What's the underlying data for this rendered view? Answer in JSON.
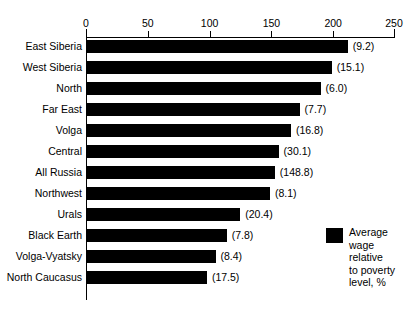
{
  "chart_data": {
    "type": "bar",
    "orientation": "horizontal",
    "title": "",
    "xlabel": "",
    "ylabel": "",
    "xlim": [
      0,
      250
    ],
    "xticks": [
      0,
      50,
      100,
      150,
      200,
      250
    ],
    "grid": false,
    "axis_position": "top",
    "categories": [
      "East Siberia",
      "West Siberia",
      "North",
      "Far East",
      "Volga",
      "Central",
      "All Russia",
      "Northwest",
      "Urals",
      "Black Earth",
      "Volga-Vyatsky",
      "North Caucasus"
    ],
    "values": [
      211,
      198,
      189,
      172,
      165,
      155,
      152,
      148,
      124,
      113,
      104,
      97
    ],
    "point_labels": [
      "(9.2)",
      "(15.1)",
      "(6.0)",
      "(7.7)",
      "(16.8)",
      "(30.1)",
      "(148.8)",
      "(8.1)",
      "(20.4)",
      "(7.8)",
      "(8.4)",
      "(17.5)"
    ],
    "legend": {
      "position": "right",
      "entries": [
        {
          "label": "Average wage relative to poverty level, %",
          "color": "#000000"
        }
      ]
    },
    "series": [
      {
        "name": "Average wage relative to poverty level, %",
        "color": "#000000",
        "values": [
          211,
          198,
          189,
          172,
          165,
          155,
          152,
          148,
          124,
          113,
          104,
          97
        ]
      }
    ]
  },
  "colors": {
    "bar": "#000000",
    "axis": "#000000",
    "background": "#ffffff"
  },
  "legend": {
    "line1": "Average",
    "line2": "wage",
    "line3": "relative",
    "line4": "to poverty",
    "line5": "level, %"
  }
}
